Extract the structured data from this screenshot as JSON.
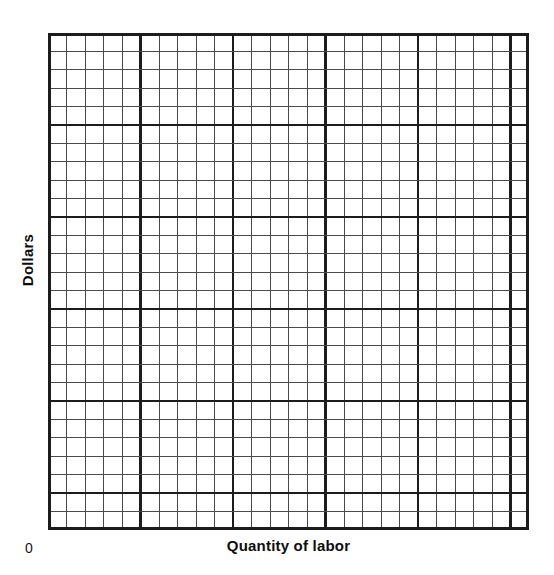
{
  "figure": {
    "type": "blank-graph-paper",
    "background_color": "#ffffff",
    "origin_label": "0"
  },
  "axes": {
    "y_label": "Dollars",
    "x_label": "Quantity of labor"
  },
  "chart_data": {
    "type": "line",
    "title": "",
    "subtitle": "",
    "xlabel": "Quantity of labor",
    "ylabel": "Dollars",
    "origin_label": "0",
    "series": [],
    "categories": [],
    "x": [],
    "values": [],
    "annotations": [],
    "legend": {
      "present": false,
      "entries": [],
      "position": "none"
    },
    "grid": {
      "visible": true,
      "style": "graph-paper",
      "minor_columns": 26,
      "minor_rows": 27,
      "minor_cell_width_px": 18.5,
      "minor_cell_height_px": 18.4,
      "major_every_n_cells": 5,
      "minor_line_color": "#4a4a4a",
      "major_line_color": "#1c1c1c",
      "border_color": "#1c1c1c",
      "minor_line_width_px": 1,
      "major_line_width_px": 2.2,
      "border_width_px": 2.6
    },
    "axis_ranges": {
      "xlim": [
        0,
        26
      ],
      "ylim": [
        0,
        27
      ]
    },
    "tick_labels": {
      "x": [],
      "y": []
    },
    "note": "Blank worksheet grid: no plotted data points, no tick values, no legend."
  },
  "colors": {
    "ink": "#0d0d0d",
    "grid_minor": "#4a4a4a",
    "grid_major": "#1c1c1c",
    "paper": "#ffffff"
  }
}
